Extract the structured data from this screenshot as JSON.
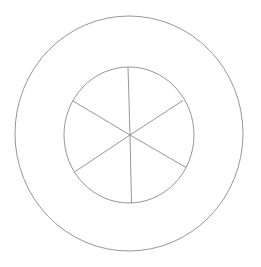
{
  "diagram": {
    "type": "concentric-circles-with-spokes",
    "background": "#ffffff",
    "stroke_color": "#8a8a8a",
    "stroke_width": 0.9,
    "outer_circle": {
      "cx": 129,
      "cy": 133.5,
      "rx": 114,
      "ry": 117.5
    },
    "inner_circle": {
      "cx": 129,
      "cy": 135,
      "rx": 65,
      "ry": 68
    },
    "hub": {
      "x": 130,
      "y": 135
    },
    "spokes": [
      {
        "label": "spoke-top",
        "x": 128,
        "y": 67.5
      },
      {
        "label": "spoke-upper-right",
        "x": 183,
        "y": 100.5
      },
      {
        "label": "spoke-lower-right",
        "x": 186,
        "y": 167.5
      },
      {
        "label": "spoke-bottom",
        "x": 131.5,
        "y": 203
      },
      {
        "label": "spoke-lower-left",
        "x": 74.5,
        "y": 172
      },
      {
        "label": "spoke-upper-left",
        "x": 73,
        "y": 101
      }
    ]
  }
}
